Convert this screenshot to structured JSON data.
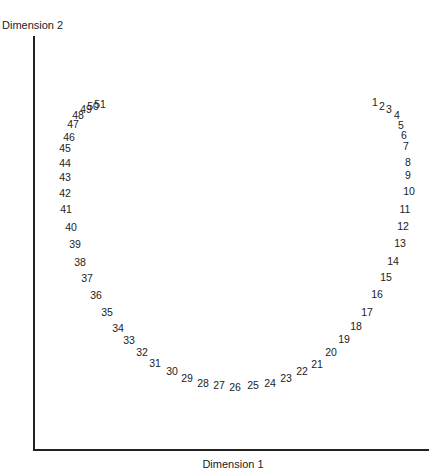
{
  "chart_data": {
    "type": "scatter",
    "title": "",
    "xlabel": "Dimension 1",
    "ylabel": "Dimension 2",
    "grid": false,
    "legend": null,
    "marker": "text-label",
    "note": "Points are drawn as their numeric labels; coordinates are pixel positions (x right, y down) within the 438x474 figure.",
    "axis_origin_px": [
      33,
      449
    ],
    "points": [
      {
        "label": "1",
        "x": 375,
        "y": 102
      },
      {
        "label": "2",
        "x": 382,
        "y": 106
      },
      {
        "label": "3",
        "x": 389,
        "y": 109
      },
      {
        "label": "4",
        "x": 397,
        "y": 115
      },
      {
        "label": "5",
        "x": 401,
        "y": 125
      },
      {
        "label": "6",
        "x": 404,
        "y": 135
      },
      {
        "label": "7",
        "x": 406,
        "y": 146
      },
      {
        "label": "8",
        "x": 408,
        "y": 162
      },
      {
        "label": "9",
        "x": 408,
        "y": 175
      },
      {
        "label": "10",
        "x": 409,
        "y": 191
      },
      {
        "label": "11",
        "x": 405,
        "y": 209
      },
      {
        "label": "12",
        "x": 403,
        "y": 226
      },
      {
        "label": "13",
        "x": 400,
        "y": 243
      },
      {
        "label": "14",
        "x": 393,
        "y": 261
      },
      {
        "label": "15",
        "x": 386,
        "y": 277
      },
      {
        "label": "16",
        "x": 377,
        "y": 294
      },
      {
        "label": "17",
        "x": 367,
        "y": 312
      },
      {
        "label": "18",
        "x": 356,
        "y": 326
      },
      {
        "label": "19",
        "x": 344,
        "y": 339
      },
      {
        "label": "20",
        "x": 331,
        "y": 352
      },
      {
        "label": "21",
        "x": 317,
        "y": 364
      },
      {
        "label": "22",
        "x": 302,
        "y": 371
      },
      {
        "label": "23",
        "x": 286,
        "y": 378
      },
      {
        "label": "24",
        "x": 270,
        "y": 383
      },
      {
        "label": "25",
        "x": 253,
        "y": 385
      },
      {
        "label": "26",
        "x": 235,
        "y": 387
      },
      {
        "label": "27",
        "x": 219,
        "y": 385
      },
      {
        "label": "28",
        "x": 203,
        "y": 383
      },
      {
        "label": "29",
        "x": 187,
        "y": 378
      },
      {
        "label": "30",
        "x": 172,
        "y": 371
      },
      {
        "label": "31",
        "x": 155,
        "y": 363
      },
      {
        "label": "32",
        "x": 142,
        "y": 352
      },
      {
        "label": "33",
        "x": 129,
        "y": 340
      },
      {
        "label": "34",
        "x": 118,
        "y": 328
      },
      {
        "label": "35",
        "x": 107,
        "y": 312
      },
      {
        "label": "36",
        "x": 96,
        "y": 295
      },
      {
        "label": "37",
        "x": 87,
        "y": 278
      },
      {
        "label": "38",
        "x": 80,
        "y": 262
      },
      {
        "label": "39",
        "x": 75,
        "y": 244
      },
      {
        "label": "40",
        "x": 71,
        "y": 227
      },
      {
        "label": "41",
        "x": 66,
        "y": 209
      },
      {
        "label": "42",
        "x": 65,
        "y": 193
      },
      {
        "label": "43",
        "x": 65,
        "y": 177
      },
      {
        "label": "44",
        "x": 65,
        "y": 163
      },
      {
        "label": "45",
        "x": 65,
        "y": 148
      },
      {
        "label": "46",
        "x": 69,
        "y": 137
      },
      {
        "label": "47",
        "x": 73,
        "y": 124
      },
      {
        "label": "48",
        "x": 78,
        "y": 115
      },
      {
        "label": "49",
        "x": 86,
        "y": 109
      },
      {
        "label": "50",
        "x": 93,
        "y": 106
      },
      {
        "label": "51",
        "x": 100,
        "y": 104
      }
    ]
  }
}
